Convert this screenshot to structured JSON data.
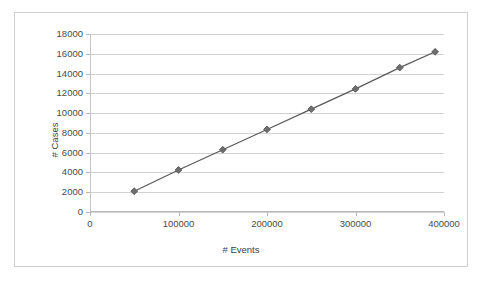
{
  "chart_data": {
    "type": "line",
    "title": "",
    "xlabel": "# Events",
    "ylabel": "# Cases",
    "xlim": [
      0,
      400000
    ],
    "ylim": [
      0,
      18000
    ],
    "xticks": [
      0,
      100000,
      200000,
      300000,
      400000
    ],
    "xtick_labels": [
      "0",
      "100000",
      "200000",
      "300000",
      "400000"
    ],
    "yticks": [
      0,
      2000,
      4000,
      6000,
      8000,
      10000,
      12000,
      14000,
      16000,
      18000
    ],
    "ytick_labels": [
      "0",
      "2000",
      "4000",
      "6000",
      "8000",
      "10000",
      "12000",
      "14000",
      "16000",
      "18000"
    ],
    "grid": "horizontal",
    "legend": "none",
    "marker": "diamond",
    "series": [
      {
        "name": "# Cases vs # Events",
        "color": "#595959",
        "x": [
          50000,
          100000,
          150000,
          200000,
          250000,
          300000,
          350000,
          390000
        ],
        "values": [
          2100,
          4250,
          6300,
          8350,
          10400,
          12450,
          14600,
          16200
        ]
      }
    ]
  },
  "figure": {
    "border_color": "#cfcfcf",
    "plot_background": "#ffffff",
    "gridline_color": "#d2d2d2",
    "axis_color": "#b8b8b8",
    "tick_text_color": "#4a4a4a",
    "axis_title_color": "#3f3f3f"
  }
}
